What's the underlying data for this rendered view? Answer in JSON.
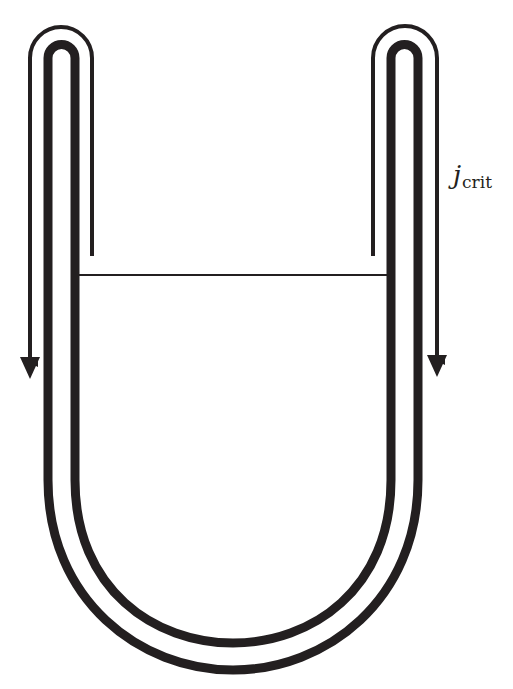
{
  "diagram": {
    "title": "",
    "colors": {
      "stroke": "#231f20",
      "background": "#ffffff"
    },
    "labels": {
      "current": {
        "main": "j",
        "sub": "crit",
        "x": 453,
        "y": 160
      }
    },
    "elements": [
      {
        "id": "u-tube",
        "kind": "double-walled U-shaped tube",
        "description": "two concentric thick U-shaped walls with closed rounded tops on each arm"
      },
      {
        "id": "left-current-path",
        "kind": "thin line with arrow",
        "direction": "down",
        "description": "thin loop over left arm top, arrow descending on outer side"
      },
      {
        "id": "right-current-path",
        "kind": "thin line with arrow",
        "direction": "down",
        "description": "thin loop over right arm top, arrow descending on outer side"
      },
      {
        "id": "level-line",
        "kind": "horizontal line",
        "description": "horizontal line connecting inner walls of the two arms"
      }
    ]
  }
}
